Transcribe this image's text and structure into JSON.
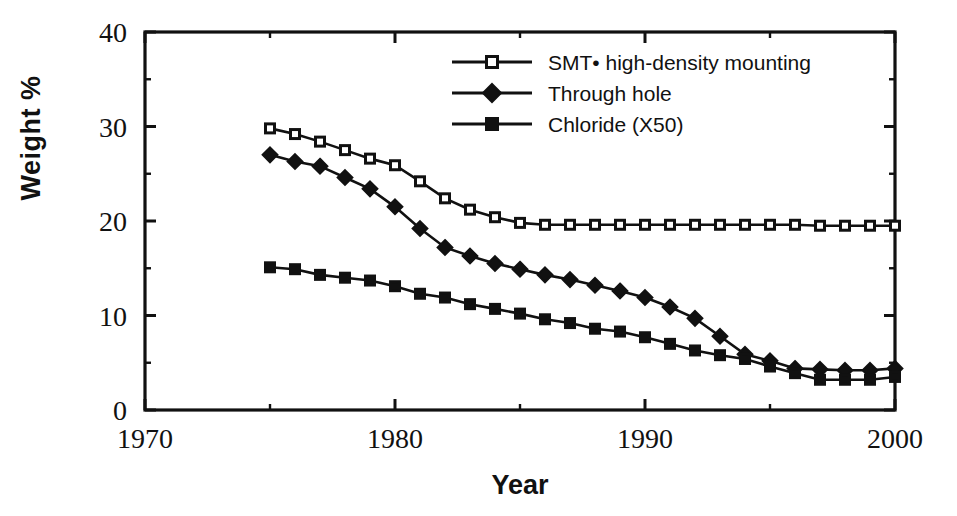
{
  "chart_data": {
    "type": "line",
    "title": "",
    "xlabel": "Year",
    "ylabel": "Weight %",
    "xlim": [
      1970,
      2000
    ],
    "ylim": [
      0,
      40
    ],
    "x_major_ticks": [
      1970,
      1980,
      1990,
      2000
    ],
    "x_minor_ticks": [
      1975,
      1985,
      1995
    ],
    "y_major_ticks": [
      0,
      10,
      20,
      30,
      40
    ],
    "y_minor_ticks": [
      5,
      15,
      25,
      35
    ],
    "grid": false,
    "legend_position": "top-right",
    "x": [
      1975,
      1976,
      1977,
      1978,
      1979,
      1980,
      1981,
      1982,
      1983,
      1984,
      1985,
      1986,
      1987,
      1988,
      1989,
      1990,
      1991,
      1992,
      1993,
      1994,
      1995,
      1996,
      1997,
      1998,
      1999,
      2000
    ],
    "series": [
      {
        "name": "SMT• high-density mounting",
        "marker": "open-square",
        "values": [
          29.8,
          29.2,
          28.4,
          27.5,
          26.6,
          25.9,
          24.2,
          22.4,
          21.2,
          20.4,
          19.8,
          19.6,
          19.6,
          19.6,
          19.6,
          19.6,
          19.6,
          19.6,
          19.6,
          19.6,
          19.6,
          19.6,
          19.5,
          19.5,
          19.5,
          19.5
        ]
      },
      {
        "name": "Through hole",
        "marker": "filled-diamond",
        "values": [
          27.0,
          26.3,
          25.8,
          24.6,
          23.4,
          21.5,
          19.2,
          17.2,
          16.3,
          15.5,
          14.9,
          14.3,
          13.8,
          13.2,
          12.6,
          11.9,
          10.9,
          9.7,
          7.8,
          5.9,
          5.2,
          4.4,
          4.3,
          4.2,
          4.2,
          4.4
        ]
      },
      {
        "name": "Chloride (X50)",
        "marker": "filled-square",
        "values": [
          15.1,
          14.9,
          14.3,
          14.0,
          13.7,
          13.1,
          12.3,
          11.9,
          11.2,
          10.7,
          10.2,
          9.6,
          9.2,
          8.6,
          8.3,
          7.7,
          7.0,
          6.3,
          5.8,
          5.4,
          4.6,
          3.9,
          3.2,
          3.2,
          3.2,
          3.5
        ]
      }
    ]
  },
  "legend": {
    "items": [
      {
        "label": "SMT• high-density mounting",
        "marker": "open-square"
      },
      {
        "label": "Through hole",
        "marker": "filled-diamond"
      },
      {
        "label": "Chloride (X50)",
        "marker": "filled-square"
      }
    ]
  },
  "axis": {
    "x_title": "Year",
    "y_title": "Weight %",
    "x_tick_labels": [
      "1970",
      "1980",
      "1990",
      "2000"
    ],
    "y_tick_labels": [
      "0",
      "10",
      "20",
      "30",
      "40"
    ]
  },
  "colors": {
    "ink": "#111111",
    "background": "#ffffff",
    "marker_fill_open": "#ffffff"
  }
}
